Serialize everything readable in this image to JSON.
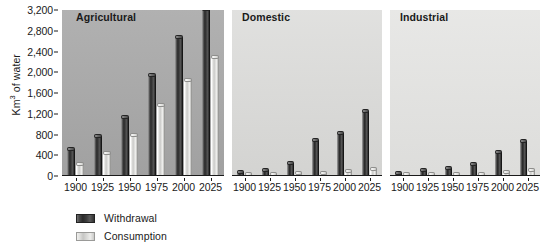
{
  "chart_data": {
    "type": "bar",
    "title": "",
    "subtitle": "",
    "ylabel_text": "Km",
    "ylabel_sup": "3",
    "ylabel_tail": " of water",
    "xlabel": "",
    "ylim": [
      0,
      3200
    ],
    "yticks": [
      0,
      400,
      800,
      1200,
      1600,
      2000,
      2400,
      2800,
      3200
    ],
    "ytick_labels": [
      "0",
      "400",
      "800",
      "1,200",
      "1,600",
      "2,000",
      "2,400",
      "2,800",
      "3,200"
    ],
    "categories": [
      "1900",
      "1925",
      "1950",
      "1975",
      "2000",
      "2025"
    ],
    "grid": false,
    "legend_position": "bottom-left",
    "legend": [
      {
        "name": "Withdrawal",
        "key": "withdrawal"
      },
      {
        "name": "Consumption",
        "key": "consumption"
      }
    ],
    "panels": [
      {
        "title": "Agricultural",
        "background": "#a8a8a8",
        "series": [
          {
            "name": "Withdrawal",
            "key": "withdrawal",
            "values": [
              520,
              780,
              1130,
              1950,
              2680,
              3220
            ]
          },
          {
            "name": "Consumption",
            "key": "consumption",
            "values": [
              240,
              450,
              800,
              1360,
              1850,
              2290
            ]
          }
        ]
      },
      {
        "title": "Domestic",
        "background": "#dadad8",
        "series": [
          {
            "name": "Withdrawal",
            "key": "withdrawal",
            "values": [
              80,
              120,
              250,
              700,
              820,
              1250
            ]
          },
          {
            "name": "Consumption",
            "key": "consumption",
            "values": [
              15,
              20,
              50,
              60,
              90,
              140
            ]
          }
        ]
      },
      {
        "title": "Industrial",
        "background": "#e2e2e0",
        "series": [
          {
            "name": "Withdrawal",
            "key": "withdrawal",
            "values": [
              50,
              110,
              160,
              240,
              460,
              670
            ]
          },
          {
            "name": "Consumption",
            "key": "consumption",
            "values": [
              15,
              25,
              35,
              45,
              80,
              110
            ]
          }
        ]
      }
    ]
  },
  "colors": {
    "withdrawal": "#3a3a3a",
    "consumption": "#e0e0de",
    "axis": "#1a1a1a",
    "page_background": "#ffffff"
  }
}
